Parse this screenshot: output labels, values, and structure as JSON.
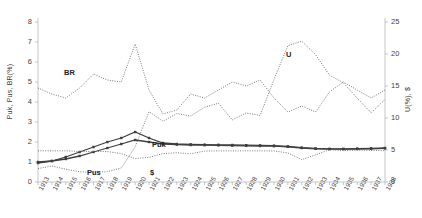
{
  "chart_data": {
    "type": "line",
    "title": "",
    "xlabel": "",
    "ylabel_left": "Puk, Pus, BR(%)",
    "ylabel_right": "U(%), $",
    "grid": false,
    "legend_position": "inline-labels",
    "x": [
      1913,
      1914,
      1915,
      1916,
      1917,
      1918,
      1919,
      1920,
      1921,
      1922,
      1923,
      1924,
      1925,
      1926,
      1927,
      1928,
      1929,
      1930,
      1931,
      1932,
      1933,
      1934,
      1935,
      1936,
      1937,
      1938
    ],
    "categories": [
      "1913",
      "1914",
      "1915",
      "1916",
      "1917",
      "1918",
      "1919",
      "1920",
      "1921",
      "1922",
      "1923",
      "1924",
      "1925",
      "1926",
      "1927",
      "1928",
      "1929",
      "1930",
      "1931",
      "1932",
      "1933",
      "1934",
      "1935",
      "1936",
      "1937",
      "1938"
    ],
    "ylim_left": [
      0,
      8
    ],
    "ylim_right": [
      0,
      25
    ],
    "yticks_left": [
      0,
      1,
      2,
      3,
      4,
      5,
      6,
      7,
      8
    ],
    "yticks_right": [
      0,
      5,
      10,
      15,
      20,
      25
    ],
    "series": [
      {
        "name": "BR",
        "label": "BR",
        "axis": "left",
        "style": "dotted",
        "markers": false,
        "values": [
          4.7,
          4.4,
          4.2,
          4.7,
          5.4,
          5.1,
          5.0,
          6.9,
          4.6,
          3.4,
          3.6,
          4.4,
          4.2,
          4.6,
          5.0,
          4.8,
          5.1,
          4.2,
          3.5,
          3.8,
          3.5,
          4.5,
          5.0,
          4.6,
          4.2,
          4.6
        ]
      },
      {
        "name": "U",
        "label": "U",
        "axis": "right",
        "style": "dotted",
        "markers": false,
        "values": [
          2.1,
          2.5,
          2.0,
          1.6,
          1.5,
          1.6,
          2.2,
          5.5,
          11.0,
          9.5,
          10.7,
          10.3,
          11.7,
          12.3,
          9.7,
          10.8,
          10.4,
          16.0,
          21.3,
          22.0,
          19.9,
          16.7,
          15.5,
          13.1,
          10.8,
          12.9
        ]
      },
      {
        "name": "Puk",
        "label": "Puk",
        "axis": "left",
        "style": "solid",
        "markers": true,
        "values": [
          0.95,
          1.05,
          1.25,
          1.5,
          1.75,
          2.0,
          2.2,
          2.5,
          2.2,
          1.95,
          1.9,
          1.88,
          1.87,
          1.86,
          1.85,
          1.84,
          1.83,
          1.82,
          1.78,
          1.72,
          1.68,
          1.66,
          1.66,
          1.67,
          1.68,
          1.7
        ]
      },
      {
        "name": "Pus",
        "label": "Pus",
        "axis": "left",
        "style": "solid",
        "markers": true,
        "values": [
          1.0,
          1.05,
          1.15,
          1.3,
          1.5,
          1.7,
          1.9,
          2.1,
          2.0,
          1.9,
          1.87,
          1.85,
          1.84,
          1.83,
          1.82,
          1.81,
          1.8,
          1.79,
          1.76,
          1.7,
          1.66,
          1.64,
          1.64,
          1.65,
          1.66,
          1.68
        ]
      },
      {
        "name": "$",
        "label": "$",
        "axis": "right",
        "style": "dotted",
        "markers": false,
        "values": [
          4.87,
          4.87,
          4.87,
          4.77,
          4.76,
          4.76,
          4.43,
          3.66,
          3.85,
          4.43,
          4.57,
          4.41,
          4.83,
          4.86,
          4.86,
          4.87,
          4.86,
          4.86,
          4.54,
          3.51,
          4.24,
          5.04,
          4.9,
          4.97,
          4.94,
          4.89
        ]
      }
    ],
    "annotations": [
      {
        "text": "BR",
        "x_px": 64,
        "y_px": 68
      },
      {
        "text": "U",
        "x_px": 286,
        "y_px": 50
      },
      {
        "text": "Puk",
        "x_px": 152,
        "y_px": 140
      },
      {
        "text": "Pus",
        "x_px": 87,
        "y_px": 168
      },
      {
        "text": "$",
        "x_px": 150,
        "y_px": 168
      }
    ],
    "colors": {
      "line": "#3f3f3f",
      "dotted": "#6b6b6b",
      "axis": "#b8b8b8",
      "text": "#444444"
    }
  }
}
